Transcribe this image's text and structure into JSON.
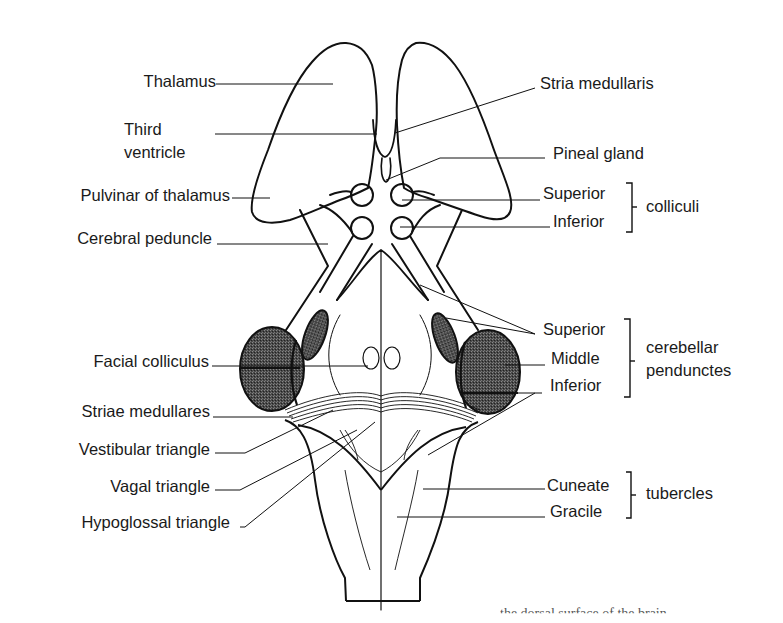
{
  "figure": {
    "colors": {
      "line": "#111111",
      "shaded": "#3a3a3a",
      "background": "#ffffff"
    },
    "left_labels": [
      {
        "id": "thalamus",
        "text": "Thalamus"
      },
      {
        "id": "third-ventricle-1",
        "text": "Third"
      },
      {
        "id": "third-ventricle-2",
        "text": "ventricle"
      },
      {
        "id": "pulvinar",
        "text": "Pulvinar of thalamus"
      },
      {
        "id": "cerebral-peduncle",
        "text": "Cerebral peduncle"
      },
      {
        "id": "facial-colliculus",
        "text": "Facial colliculus"
      },
      {
        "id": "striae-medullares",
        "text": "Striae medullares"
      },
      {
        "id": "vestibular-triangle",
        "text": "Vestibular triangle"
      },
      {
        "id": "vagal-triangle",
        "text": "Vagal triangle"
      },
      {
        "id": "hypoglossal-triangle",
        "text": "Hypoglossal triangle"
      }
    ],
    "right_labels": [
      {
        "id": "stria-medullaris",
        "text": "Stria medullaris"
      },
      {
        "id": "pineal-gland",
        "text": "Pineal gland"
      },
      {
        "id": "superior-colliculus",
        "text": "Superior"
      },
      {
        "id": "inferior-colliculus",
        "text": "Inferior"
      },
      {
        "id": "superior-cerebellar",
        "text": "Superior"
      },
      {
        "id": "middle-cerebellar",
        "text": "Middle"
      },
      {
        "id": "inferior-cerebellar",
        "text": "Inferior"
      },
      {
        "id": "cuneate",
        "text": "Cuneate"
      },
      {
        "id": "gracile",
        "text": "Gracile"
      }
    ],
    "group_labels": [
      {
        "id": "colliculi",
        "text": "colliculi"
      },
      {
        "id": "cerebellar-1",
        "text": "cerebellar"
      },
      {
        "id": "cerebellar-2",
        "text": "pendunctes"
      },
      {
        "id": "tubercles",
        "text": "tubercles"
      }
    ],
    "caption_fragment": "the dorsal surface of the brain"
  }
}
